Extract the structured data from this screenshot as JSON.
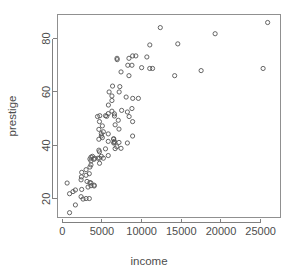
{
  "chart_data": {
    "type": "scatter",
    "title": "",
    "xlabel": "income",
    "ylabel": "prestige",
    "xlim": [
      -600,
      27500
    ],
    "ylim": [
      13,
      89
    ],
    "grid": false,
    "legend": null,
    "marker": {
      "shape": "open-circle",
      "radius_px": 2.1,
      "color": "#555555"
    },
    "xticks": [
      0,
      5000,
      10000,
      15000,
      20000,
      25000
    ],
    "xtick_labels": [
      "0",
      "5000",
      "10000",
      "15000",
      "20000",
      "25000"
    ],
    "yticks": [
      20,
      40,
      60,
      80
    ],
    "ytick_labels": [
      "20",
      "40",
      "60",
      "80"
    ],
    "x": [
      12351,
      25879,
      9271,
      8865,
      8403,
      11030,
      10660,
      8258,
      14558,
      11377,
      11023,
      14163,
      6900,
      6920,
      10000,
      17498,
      19263,
      25308,
      8780,
      7405,
      8403,
      6336,
      7252,
      7170,
      5902,
      6259,
      8049,
      5813,
      9593,
      6259,
      8880,
      4729,
      4443,
      4686,
      5052,
      8780,
      6259,
      5795,
      5449,
      5606,
      4614,
      5180,
      4921,
      4921,
      4614,
      5795,
      7482,
      6573,
      6573,
      8206,
      8425,
      7059,
      8865,
      6662,
      7147,
      8865,
      6477,
      6573,
      7147,
      8206,
      5052,
      6477,
      5795,
      6573,
      6477,
      6870,
      7405,
      6662,
      5449,
      4614,
      4686,
      5795,
      4921,
      3804,
      3617,
      4696,
      4497,
      4075,
      5180,
      3485,
      4007,
      3617,
      4696,
      3617,
      3485,
      3000,
      2448,
      3406,
      3000,
      2411,
      2370,
      3116,
      3485,
      3617,
      4021,
      3617,
      4021,
      3246,
      2448,
      1656,
      1358,
      918,
      611,
      2370,
      3000,
      2621,
      1656,
      918,
      3408
    ],
    "y": [
      84.1,
      86.0,
      73.5,
      73.5,
      72.6,
      77.6,
      73.1,
      70.0,
      78.0,
      68.8,
      68.8,
      66.1,
      72.6,
      72.1,
      69.1,
      68.0,
      81.8,
      68.8,
      70.0,
      67.5,
      66.1,
      62.2,
      62.0,
      60.0,
      60.0,
      58.5,
      58.1,
      55.1,
      57.6,
      56.8,
      57.6,
      51.1,
      50.8,
      48.9,
      47.3,
      53.8,
      52.8,
      51.9,
      51.1,
      50.9,
      46.0,
      45.1,
      44.4,
      43.5,
      42.3,
      44.3,
      53.1,
      51.8,
      51.0,
      52.5,
      50.8,
      49.4,
      48.9,
      47.7,
      46.1,
      43.5,
      42.5,
      41.5,
      41.1,
      40.9,
      42.9,
      42.3,
      41.5,
      41.1,
      40.9,
      39.5,
      38.9,
      38.8,
      38.7,
      38.2,
      37.6,
      36.2,
      35.9,
      35.9,
      35.6,
      35.2,
      35.2,
      35.2,
      35.2,
      34.9,
      34.8,
      34.2,
      33.3,
      32.7,
      31.9,
      30.9,
      29.9,
      29.4,
      28.8,
      28.2,
      27.1,
      26.5,
      26.1,
      25.9,
      25.1,
      24.9,
      24.8,
      24.4,
      23.5,
      23.3,
      22.7,
      21.9,
      25.9,
      20.8,
      20.1,
      19.9,
      17.7,
      14.8,
      20.1
    ]
  },
  "axes": {
    "x_title": "income",
    "y_title": "prestige"
  }
}
